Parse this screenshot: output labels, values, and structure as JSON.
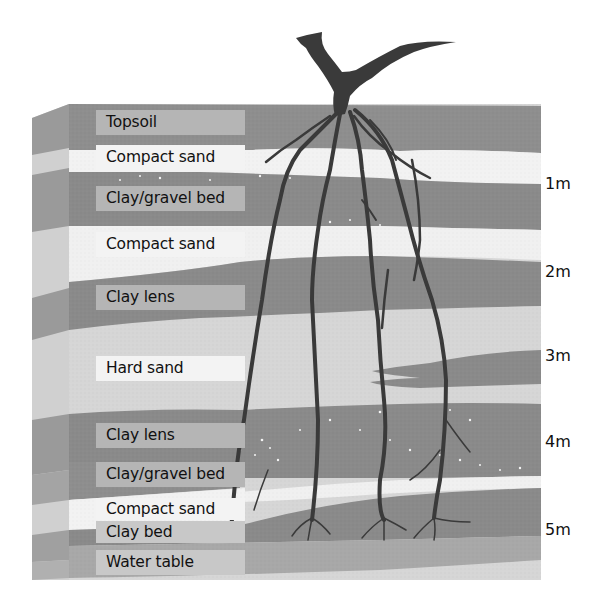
{
  "diagram": {
    "type": "soil-profile-cross-section",
    "layers": [
      {
        "label": "Topsoil",
        "shade": "#8e8e8e",
        "label_bg": "#b5b5b5"
      },
      {
        "label": "Compact sand",
        "shade": "#f2f2f2",
        "label_bg": "#f3f3f3"
      },
      {
        "label": "Clay/gravel bed",
        "shade": "#8a8a8a",
        "label_bg": "#b5b5b5"
      },
      {
        "label": "Compact sand",
        "shade": "#f0f0f0",
        "label_bg": "#f3f3f3"
      },
      {
        "label": "Clay lens",
        "shade": "#8a8a8a",
        "label_bg": "#b5b5b5"
      },
      {
        "label": "Hard sand",
        "shade": "#d6d6d6",
        "label_bg": "#f3f3f3"
      },
      {
        "label": "Clay lens",
        "shade": "#8a8a8a",
        "label_bg": "#b5b5b5"
      },
      {
        "label": "Clay/gravel bed",
        "shade": "#8a8a8a",
        "label_bg": "#b5b5b5"
      },
      {
        "label": "Compact sand",
        "shade": "#f0f0f0",
        "label_bg": "#f3f3f3"
      },
      {
        "label": "Clay bed",
        "shade": "#8a8a8a",
        "label_bg": "#b5b5b5"
      },
      {
        "label": "Water table",
        "shade": "#a8a8a8",
        "label_bg": "#c8c8c8"
      }
    ],
    "depth_markers": [
      "1m",
      "2m",
      "3m",
      "4m",
      "5m"
    ],
    "colors": {
      "root": "#3a3a3a",
      "clay": "#8a8a8a",
      "sand_light": "#f2f2f2",
      "hard_sand": "#d6d6d6",
      "water_table": "#a8a8a8",
      "side_face": "#9a9a9a"
    }
  }
}
